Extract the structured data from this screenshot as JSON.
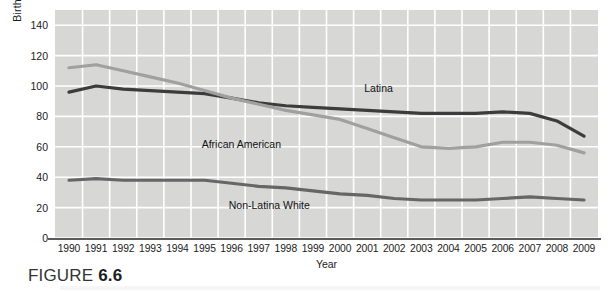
{
  "figure": {
    "caption_word": "FIGURE",
    "caption_number": "6.6"
  },
  "chart_data": {
    "type": "line",
    "title": "",
    "xlabel": "Year",
    "ylabel": "Birth rate per 1,000 females ages 15–19",
    "x": [
      1990,
      1991,
      1992,
      1993,
      1994,
      1995,
      1996,
      1997,
      1998,
      1999,
      2000,
      2001,
      2002,
      2003,
      2004,
      2005,
      2006,
      2007,
      2008,
      2009
    ],
    "categories": [
      "1990",
      "1991",
      "1992",
      "1993",
      "1994",
      "1995",
      "1996",
      "1997",
      "1998",
      "1999",
      "2000",
      "2001",
      "2002",
      "2003",
      "2004",
      "2005",
      "2006",
      "2007",
      "2008",
      "2009"
    ],
    "xlim": [
      1990,
      2009
    ],
    "ylim": [
      0,
      150
    ],
    "yticks": [
      0,
      20,
      40,
      60,
      80,
      100,
      120,
      140
    ],
    "ytick_labels": [
      "0",
      "20",
      "40",
      "60",
      "80",
      "100",
      "120",
      "140"
    ],
    "grid": true,
    "legend_position": "inline-annotations",
    "series": [
      {
        "name": "Latina",
        "color": "#3c3c3c",
        "values": [
          96,
          100,
          98,
          97,
          96,
          95,
          92,
          89,
          87,
          86,
          85,
          84,
          83,
          82,
          82,
          82,
          83,
          82,
          77,
          67
        ],
        "label_x": 2002,
        "label_y": 99
      },
      {
        "name": "African American",
        "color": "#a0a0a0",
        "values": [
          112,
          114,
          110,
          106,
          102,
          97,
          92,
          88,
          84,
          81,
          78,
          72,
          66,
          60,
          59,
          60,
          63,
          63,
          61,
          56
        ],
        "label_x": 1996,
        "label_y": 62
      },
      {
        "name": "Non-Latina White",
        "color": "#666666",
        "values": [
          38,
          39,
          38,
          38,
          38,
          38,
          36,
          34,
          33,
          31,
          29,
          28,
          26,
          25,
          25,
          25,
          26,
          27,
          26,
          25
        ],
        "label_x": 1997,
        "label_y": 22
      }
    ]
  }
}
